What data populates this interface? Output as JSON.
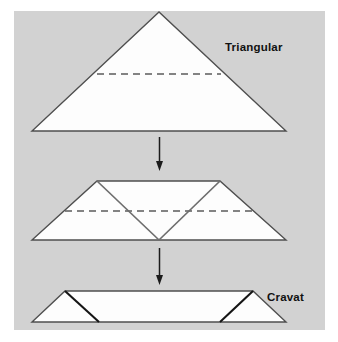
{
  "diagram": {
    "type": "instructional-fold-sequence",
    "background_color": "#ffffff",
    "panel_color": "#d2d2d2",
    "shape_fill_color": "#fdfdfd",
    "outline_color": "#4f4f4f",
    "fold_line_color": "#6e6e6e",
    "dash_line_color": "#5b5b5b",
    "arrow_color": "#1b1b1b",
    "label_color": "#111111",
    "steps": [
      {
        "index": 1,
        "label": "Triangular",
        "shape": "triangle",
        "points": "159,12 32,131 286,131",
        "guide_line": {
          "type": "dashed",
          "x1": 97,
          "y1": 74,
          "x2": 221,
          "y2": 74
        }
      },
      {
        "index": 2,
        "label": "",
        "shape": "trapezoid-with-v-fold",
        "outline": "97,181 220,181 286,240 32,240",
        "fold_left": "97,181 159,240",
        "fold_right": "220,181 159,240",
        "guide_line": {
          "type": "dashed",
          "x1": 65,
          "y1": 211,
          "x2": 253,
          "y2": 211
        }
      },
      {
        "index": 3,
        "label": "Cravat",
        "shape": "flat-trapezoid",
        "outline": "65,291 253,291 286,322 32,322",
        "fold_left": "65,291 99,322",
        "fold_right": "253,291 220,322"
      }
    ],
    "arrows": [
      {
        "name": "arrow-step-1-to-2",
        "x": 159,
        "y_start": 137,
        "y_end": 171
      },
      {
        "name": "arrow-step-2-to-3",
        "x": 159,
        "y_start": 248,
        "y_end": 285
      }
    ],
    "labels": {
      "triangular": "Triangular",
      "cravat": "Cravat"
    }
  }
}
